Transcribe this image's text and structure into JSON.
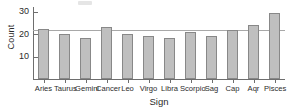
{
  "chart_data": {
    "type": "bar",
    "title": "",
    "xlabel": "Sign",
    "ylabel": "Count",
    "categories": [
      "Aries",
      "Taurus",
      "Gemini",
      "Cancer",
      "Leo",
      "Virgo",
      "Libra",
      "Scorpio",
      "Sag",
      "Cap",
      "Aqr",
      "Pisces"
    ],
    "values": [
      22.3,
      19.8,
      18.2,
      23.0,
      20.2,
      19.0,
      18.2,
      21.0,
      19.2,
      22.0,
      24.0,
      29.3
    ],
    "ylim": [
      0,
      32
    ],
    "yticks": [
      10,
      20,
      30
    ],
    "ytick_labels": [
      "10",
      "20",
      "30"
    ],
    "grid": false,
    "legend": null,
    "annotations": [
      {
        "type": "reference-line",
        "orientation": "horizontal",
        "value": 22.0,
        "label": ""
      }
    ],
    "bar_fill_color": "#bfbfbf",
    "bar_edge_color": "#888888",
    "axis_color": "#6e6e6e",
    "reference_line_color": "#a8a8a8"
  }
}
